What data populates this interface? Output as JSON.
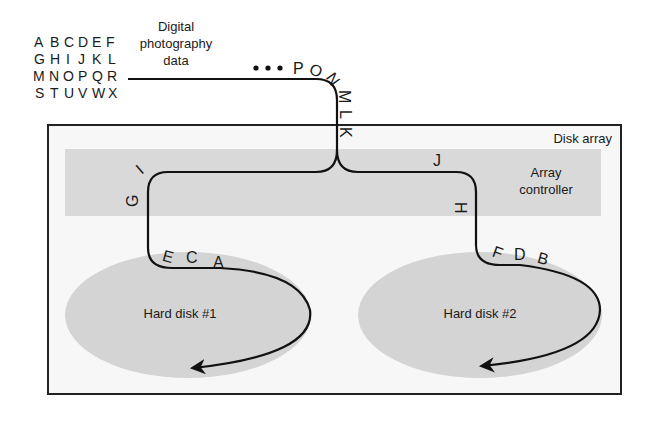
{
  "source_data": {
    "label_lines": [
      "Digital",
      "photography",
      "data"
    ],
    "letter_grid": [
      [
        "A",
        "B",
        "C",
        "D",
        "E",
        "F"
      ],
      [
        "G",
        "H",
        "I",
        "J",
        "K",
        "L"
      ],
      [
        "M",
        "N",
        "O",
        "P",
        "Q",
        "R"
      ],
      [
        "S",
        "T",
        "U",
        "V",
        "W",
        "X"
      ]
    ]
  },
  "stream": {
    "ellipsis": "•••",
    "incoming_letters": [
      "P",
      "O",
      "N",
      "M",
      "L",
      "K"
    ],
    "left_branch_letters": [
      "I",
      "G"
    ],
    "right_branch_letters": [
      "J",
      "H"
    ],
    "disk1_letters": [
      "E",
      "C",
      "A"
    ],
    "disk2_letters": [
      "F",
      "D",
      "B"
    ]
  },
  "disk_array": {
    "title": "Disk array",
    "controller_lines": [
      "Array",
      "controller"
    ],
    "disks": [
      {
        "label": "Hard disk #1"
      },
      {
        "label": "Hard disk #2"
      }
    ]
  },
  "colors": {
    "line": "#111111",
    "box_border": "#222222",
    "controller_fill": "#d9d9d9",
    "disk_fill": "#d4d4d4",
    "array_bg": "#f7f7f7"
  }
}
